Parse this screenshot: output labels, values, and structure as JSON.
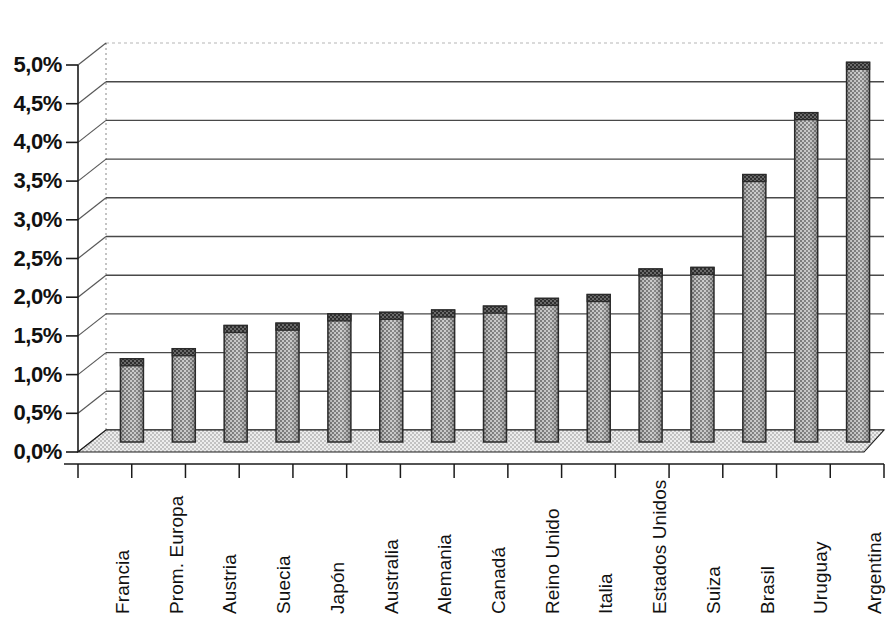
{
  "chart_data": {
    "type": "bar",
    "title": "",
    "subtitle": "",
    "xlabel": "",
    "ylabel": "",
    "ylim": [
      0,
      5
    ],
    "ytick_labels": [
      "0,0%",
      "0,5%",
      "1,0%",
      "1,5%",
      "2,0%",
      "2,5%",
      "3,0%",
      "3,5%",
      "4,0%",
      "4,5%",
      "5,0%"
    ],
    "ytick_values": [
      0,
      0.5,
      1.0,
      1.5,
      2.0,
      2.5,
      3.0,
      3.5,
      4.0,
      4.5,
      5.0
    ],
    "grid": true,
    "legend": "none",
    "style": "3d-cylinder-bars",
    "decimal_separator": ",",
    "unit": "%",
    "categories": [
      "Francia",
      "Prom. Europa",
      "Austria",
      "Suecia",
      "Japón",
      "Australia",
      "Alemania",
      "Canadá",
      "Reino Unido",
      "Italia",
      "Estados Unidos",
      "Suiza",
      "Brasil",
      "Uruguay",
      "Argentina"
    ],
    "values": [
      0.92,
      1.05,
      1.35,
      1.38,
      1.5,
      1.52,
      1.55,
      1.6,
      1.7,
      1.75,
      2.08,
      2.1,
      3.3,
      4.1,
      4.75
    ],
    "value_labels": [
      "0,92%",
      "1,05%",
      "1,35%",
      "1,38%",
      "1,50%",
      "1,52%",
      "1,55%",
      "1,60%",
      "1,70%",
      "1,75%",
      "2,08%",
      "2,10%",
      "3,30%",
      "4,10%",
      "4,75%"
    ]
  },
  "colors": {
    "bar_fill": "#9a9a9a",
    "bar_fill_light": "#b4b4b4",
    "bar_cap": "#4a4a4a",
    "bar_outline": "#2b2b2b",
    "floor": "#d8d8d8",
    "gridline": "#3a3a3a",
    "axis": "#1a1a1a",
    "background": "#ffffff",
    "text": "#111111"
  }
}
